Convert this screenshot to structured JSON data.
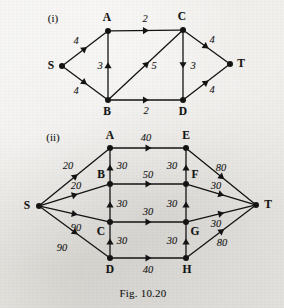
{
  "figure": {
    "caption": "Fig. 10.20",
    "caption_pos": {
      "x": 143,
      "y": 293
    },
    "background_color": "#e9e7e3",
    "ink_color": "#141414"
  },
  "parts": [
    {
      "id": "i",
      "label": "(i)",
      "x": 53,
      "y": 18
    },
    {
      "id": "ii",
      "label": "(ii)",
      "x": 53,
      "y": 137
    }
  ],
  "graphs": [
    {
      "id": "graph-i",
      "part_label": "(i)",
      "nodes": [
        {
          "id": "S",
          "label": "S",
          "x": 62,
          "y": 66,
          "label_x": 51,
          "label_y": 66
        },
        {
          "id": "A",
          "label": "A",
          "x": 108,
          "y": 31,
          "label_x": 107,
          "label_y": 18
        },
        {
          "id": "C",
          "label": "C",
          "x": 183,
          "y": 30,
          "label_x": 182,
          "label_y": 17
        },
        {
          "id": "B",
          "label": "B",
          "x": 108,
          "y": 100,
          "label_x": 107,
          "label_y": 112
        },
        {
          "id": "D",
          "label": "D",
          "x": 183,
          "y": 100,
          "label_x": 183,
          "label_y": 112
        },
        {
          "id": "T",
          "label": "T",
          "x": 230,
          "y": 64,
          "label_x": 241,
          "label_y": 64
        }
      ],
      "edges": [
        {
          "from": "S",
          "to": "A",
          "weight": "4",
          "label_x": 76,
          "label_y": 41
        },
        {
          "from": "S",
          "to": "B",
          "weight": "4",
          "label_x": 76,
          "label_y": 91
        },
        {
          "from": "A",
          "to": "C",
          "weight": "2",
          "label_x": 145,
          "label_y": 19
        },
        {
          "from": "B",
          "to": "A",
          "weight": "3",
          "label_x": 100,
          "label_y": 66
        },
        {
          "from": "B",
          "to": "C",
          "weight": "5",
          "label_x": 154,
          "label_y": 66
        },
        {
          "from": "B",
          "to": "D",
          "weight": "2",
          "label_x": 146,
          "label_y": 111
        },
        {
          "from": "C",
          "to": "D",
          "weight": "3",
          "label_x": 193,
          "label_y": 66
        },
        {
          "from": "C",
          "to": "T",
          "weight": "4",
          "label_x": 212,
          "label_y": 40
        },
        {
          "from": "D",
          "to": "T",
          "weight": "4",
          "label_x": 212,
          "label_y": 90
        }
      ]
    },
    {
      "id": "graph-ii",
      "part_label": "(ii)",
      "nodes": [
        {
          "id": "S",
          "label": "S",
          "x": 39,
          "y": 206,
          "label_x": 27,
          "label_y": 206
        },
        {
          "id": "A",
          "label": "A",
          "x": 110,
          "y": 148,
          "label_x": 110,
          "label_y": 136
        },
        {
          "id": "B",
          "label": "B",
          "x": 110,
          "y": 184,
          "label_x": 101,
          "label_y": 175
        },
        {
          "id": "C",
          "label": "C",
          "x": 110,
          "y": 222,
          "label_x": 101,
          "label_y": 232
        },
        {
          "id": "D",
          "label": "D",
          "x": 110,
          "y": 258,
          "label_x": 110,
          "label_y": 270
        },
        {
          "id": "E",
          "label": "E",
          "x": 186,
          "y": 148,
          "label_x": 186,
          "label_y": 136
        },
        {
          "id": "F",
          "label": "F",
          "x": 186,
          "y": 184,
          "label_x": 195,
          "label_y": 175
        },
        {
          "id": "G",
          "label": "G",
          "x": 186,
          "y": 222,
          "label_x": 195,
          "label_y": 232
        },
        {
          "id": "H",
          "label": "H",
          "x": 186,
          "y": 258,
          "label_x": 187,
          "label_y": 270
        },
        {
          "id": "T",
          "label": "T",
          "x": 256,
          "y": 205,
          "label_x": 268,
          "label_y": 205
        }
      ],
      "edges": [
        {
          "from": "S",
          "to": "A",
          "weight": "20",
          "label_x": 68,
          "label_y": 166
        },
        {
          "from": "S",
          "to": "B",
          "weight": "20",
          "label_x": 76,
          "label_y": 186
        },
        {
          "from": "S",
          "to": "C",
          "weight": "90",
          "label_x": 76,
          "label_y": 228
        },
        {
          "from": "S",
          "to": "D",
          "weight": "90",
          "label_x": 62,
          "label_y": 248
        },
        {
          "from": "A",
          "to": "E",
          "weight": "40",
          "label_x": 146,
          "label_y": 138
        },
        {
          "from": "B",
          "to": "A",
          "weight": "30",
          "label_x": 122,
          "label_y": 166
        },
        {
          "from": "B",
          "to": "F",
          "weight": "50",
          "label_x": 148,
          "label_y": 175
        },
        {
          "from": "C",
          "to": "B",
          "weight": "30",
          "label_x": 122,
          "label_y": 204
        },
        {
          "from": "C",
          "to": "G",
          "weight": "30",
          "label_x": 148,
          "label_y": 212
        },
        {
          "from": "D",
          "to": "C",
          "weight": "30",
          "label_x": 122,
          "label_y": 241
        },
        {
          "from": "D",
          "to": "H",
          "weight": "40",
          "label_x": 148,
          "label_y": 270
        },
        {
          "from": "F",
          "to": "E",
          "weight": "30",
          "label_x": 172,
          "label_y": 166
        },
        {
          "from": "G",
          "to": "F",
          "weight": "30",
          "label_x": 172,
          "label_y": 204
        },
        {
          "from": "H",
          "to": "G",
          "weight": "30",
          "label_x": 172,
          "label_y": 241
        },
        {
          "from": "E",
          "to": "T",
          "weight": "80",
          "label_x": 221,
          "label_y": 168
        },
        {
          "from": "F",
          "to": "T",
          "weight": "30",
          "label_x": 216,
          "label_y": 186
        },
        {
          "from": "G",
          "to": "T",
          "weight": "30",
          "label_x": 216,
          "label_y": 224
        },
        {
          "from": "H",
          "to": "T",
          "weight": "80",
          "label_x": 222,
          "label_y": 243
        }
      ]
    }
  ]
}
